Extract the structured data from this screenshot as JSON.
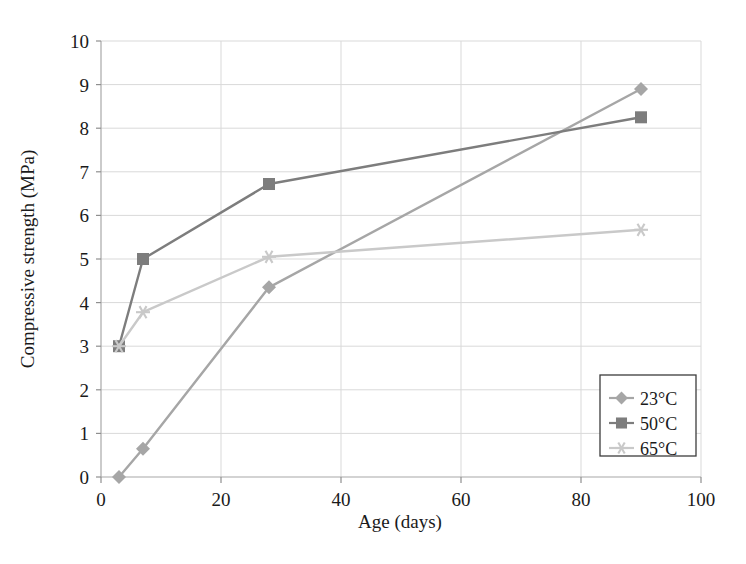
{
  "chart_data": {
    "type": "line",
    "title": "",
    "xlabel": "Age (days)",
    "ylabel": "Compressive strength (MPa)",
    "xlim": [
      0,
      100
    ],
    "ylim": [
      0,
      10
    ],
    "xticks": [
      0,
      20,
      40,
      60,
      80,
      100
    ],
    "yticks": [
      0,
      1,
      2,
      3,
      4,
      5,
      6,
      7,
      8,
      9,
      10
    ],
    "xtick_labels": [
      "0",
      "20",
      "40",
      "60",
      "80",
      "100"
    ],
    "ytick_labels": [
      "0",
      "1",
      "2",
      "3",
      "4",
      "5",
      "6",
      "7",
      "8",
      "9",
      "10"
    ],
    "grid": true,
    "grid_color": "#d9d9d9",
    "legend_position": "lower-right",
    "series": [
      {
        "name": "23°C",
        "marker": "diamond",
        "color": "#a6a6a6",
        "x": [
          3,
          7,
          28,
          90
        ],
        "y": [
          0.0,
          0.65,
          4.35,
          8.9
        ]
      },
      {
        "name": "50°C",
        "marker": "square",
        "color": "#7d7d7d",
        "x": [
          3,
          7,
          28,
          90
        ],
        "y": [
          3.0,
          5.0,
          6.72,
          8.25
        ]
      },
      {
        "name": "65°C",
        "marker": "asterisk",
        "color": "#c9c9c9",
        "x": [
          3,
          7,
          28,
          90
        ],
        "y": [
          3.0,
          3.78,
          5.05,
          5.67
        ]
      }
    ]
  },
  "legend": {
    "entries": [
      {
        "label": "23°C"
      },
      {
        "label": "50°C"
      },
      {
        "label": "65°C"
      }
    ]
  },
  "axes": {
    "x_title": "Age (days)",
    "y_title": "Compressive strength (MPa)"
  }
}
